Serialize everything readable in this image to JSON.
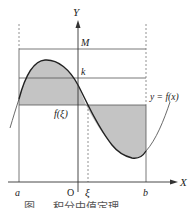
{
  "figure": {
    "axes": {
      "x_label": "X",
      "y_label": "Y",
      "origin_label": "O"
    },
    "labels": {
      "a": "a",
      "b": "b",
      "xi": "ξ",
      "M": "M",
      "k": "k",
      "f_xi": "f(ξ)",
      "curve": "y = f(x)"
    },
    "caption": "图 … 积分中值定理",
    "colors": {
      "line": "#333333",
      "fill": "#c4c4c4",
      "guide": "#777777"
    }
  }
}
